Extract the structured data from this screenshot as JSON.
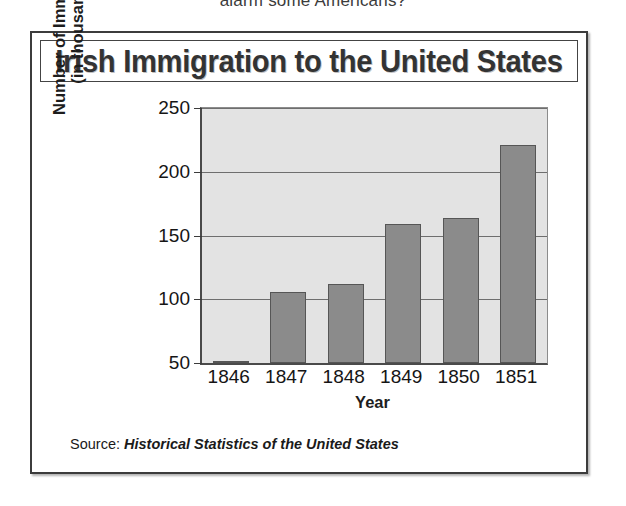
{
  "clipped_header_text": "alarm some Americans?",
  "figure": {
    "title": "Irish Immigration to the United States",
    "source_prefix": "Source:",
    "source_work": "Historical Statistics of the United States"
  },
  "chart_data": {
    "type": "bar",
    "title": "Irish Immigration to the United States",
    "xlabel": "Year",
    "ylabel": "Number of Immigrants (in thousands)",
    "ylabel_line1": "Number of Immigrants",
    "ylabel_line2": "(in thousands)",
    "categories": [
      "1846",
      "1847",
      "1848",
      "1849",
      "1850",
      "1851"
    ],
    "values": [
      51,
      106,
      112,
      159,
      164,
      221
    ],
    "unit": "thousands",
    "ylim": [
      50,
      250
    ],
    "yticks": [
      50,
      100,
      150,
      200,
      250
    ],
    "ytick_labels": [
      "50",
      "100",
      "150",
      "200",
      "250"
    ],
    "grid": true,
    "legend": false,
    "bar_color": "#8b8b8b",
    "plot_background": "#e3e3e3",
    "source": "Historical Statistics of the United States"
  }
}
